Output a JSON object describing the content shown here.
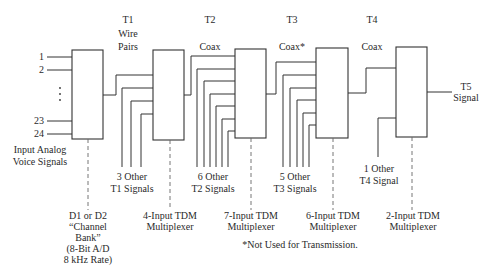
{
  "levels": [
    {
      "id": "T1",
      "label": "T1",
      "medium": "Wire Pairs",
      "x": 128
    },
    {
      "id": "T2",
      "label": "T2",
      "medium": "Coax",
      "x": 210
    },
    {
      "id": "T3",
      "label": "T3",
      "medium": "Coax*",
      "x": 292
    },
    {
      "id": "T4",
      "label": "T4",
      "medium": "Coax",
      "x": 372
    }
  ],
  "input_labels": {
    "lines": [
      "1",
      "2",
      "23",
      "24"
    ],
    "ellipsis": "⋮",
    "caption_line1": "Input Analog",
    "caption_line2": "Voice Signals"
  },
  "blocks": [
    {
      "id": "channel-bank",
      "x": 72,
      "y": 50,
      "w": 31,
      "h": 89,
      "caption": [
        "D1 or D2",
        "“Channel",
        "Bank”",
        "(8-Bit A/D",
        "8 kHz Rate)"
      ]
    },
    {
      "id": "mux-4",
      "x": 153,
      "y": 50,
      "w": 31,
      "h": 90,
      "caption": [
        "4-Input TDM",
        "Multiplexer"
      ]
    },
    {
      "id": "mux-7",
      "x": 235,
      "y": 49,
      "w": 31,
      "h": 89,
      "caption": [
        "7-Input TDM",
        "Multiplexer"
      ]
    },
    {
      "id": "mux-6",
      "x": 316,
      "y": 48,
      "w": 32,
      "h": 90,
      "caption": [
        "6-Input TDM",
        "Multiplexer"
      ]
    },
    {
      "id": "mux-2",
      "x": 396,
      "y": 47,
      "w": 31,
      "h": 90,
      "caption": [
        "2-Input TDM",
        "Multiplexer"
      ]
    }
  ],
  "other_signals": [
    {
      "line1": "3 Other",
      "line2": "T1 Signals"
    },
    {
      "line1": "6 Other",
      "line2": "T2 Signals"
    },
    {
      "line1": "5 Other",
      "line2": "T3 Signals"
    },
    {
      "line1": "1 Other",
      "line2": "T4 Signal"
    }
  ],
  "output": {
    "line1": "T5",
    "line2": "Signal"
  },
  "footnote": "*Not Used for Transmission."
}
